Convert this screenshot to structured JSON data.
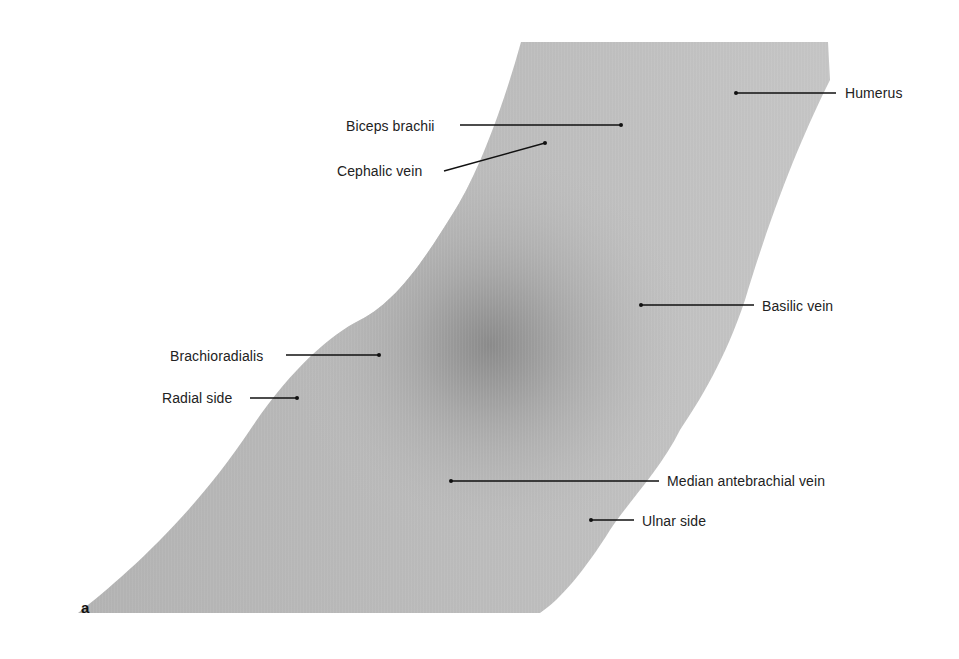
{
  "figure": {
    "panel_letter": "a",
    "background": "#ffffff",
    "arm_fill": "#b9b9b9",
    "arm_shadow": "#8e8e8e",
    "leader_color": "#111111",
    "labels": [
      {
        "id": "humerus",
        "text": "Humerus",
        "text_x": 845,
        "text_y": 85,
        "line": [
          736,
          93,
          836,
          93
        ]
      },
      {
        "id": "biceps-brachii",
        "text": "Biceps brachii",
        "text_x": 346,
        "text_y": 118,
        "line": [
          460,
          125,
          621,
          125
        ]
      },
      {
        "id": "cephalic-vein",
        "text": "Cephalic vein",
        "text_x": 337,
        "text_y": 163,
        "line": [
          444,
          171,
          545,
          143
        ]
      },
      {
        "id": "basilic-vein",
        "text": "Basilic vein",
        "text_x": 762,
        "text_y": 298,
        "line": [
          641,
          305,
          754,
          305
        ]
      },
      {
        "id": "brachioradialis",
        "text": "Brachioradialis",
        "text_x": 170,
        "text_y": 348,
        "line": [
          286,
          355,
          379,
          355
        ]
      },
      {
        "id": "radial-side",
        "text": "Radial side",
        "text_x": 162,
        "text_y": 390,
        "line": [
          250,
          398,
          297,
          398
        ]
      },
      {
        "id": "median-antebrachial-vein",
        "text": "Median antebrachial vein",
        "text_x": 667,
        "text_y": 473,
        "line": [
          451,
          481,
          659,
          481
        ]
      },
      {
        "id": "ulnar-side",
        "text": "Ulnar side",
        "text_x": 642,
        "text_y": 513,
        "line": [
          591,
          520,
          634,
          520
        ]
      }
    ]
  }
}
